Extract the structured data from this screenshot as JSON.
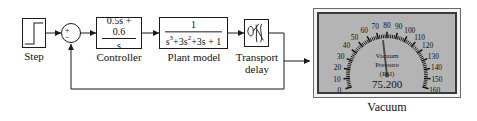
{
  "diagram": {
    "blocks": {
      "step": {
        "label": "Step",
        "icon": "step-signal-icon"
      },
      "sum": {
        "plus": "+",
        "minus": "−"
      },
      "controller": {
        "label": "Controller",
        "numerator": "0.5s + 0.6",
        "denominator": "s"
      },
      "plant": {
        "label": "Plant model",
        "numerator": "1",
        "denominator_pre": "s",
        "denominator_terms": "3+3s2+3s + 1",
        "denominator_plain": "s3+3s2+3s + 1"
      },
      "delay": {
        "label_line1": "Transport",
        "label_line2": "delay",
        "icon": "transport-delay-waveform-icon"
      },
      "gauge": {
        "label": "Vacuum",
        "title_line1": "Vacuum",
        "title_line2": "Pressure",
        "units": "(PSI)",
        "readout": "75.200",
        "value": 75.2,
        "min": 0,
        "max": 160,
        "tick_step": 10,
        "ticks": [
          0,
          10,
          20,
          30,
          40,
          50,
          60,
          70,
          80,
          90,
          100,
          110,
          120,
          130,
          140,
          150,
          160
        ],
        "face_color": "#b4b4b4",
        "needle_color": "#4a4a4a",
        "scale_color": "#111111"
      }
    },
    "colors": {
      "line": "#1a1a1a",
      "block_fill": "#ffffff",
      "background": "#ffffff"
    }
  }
}
